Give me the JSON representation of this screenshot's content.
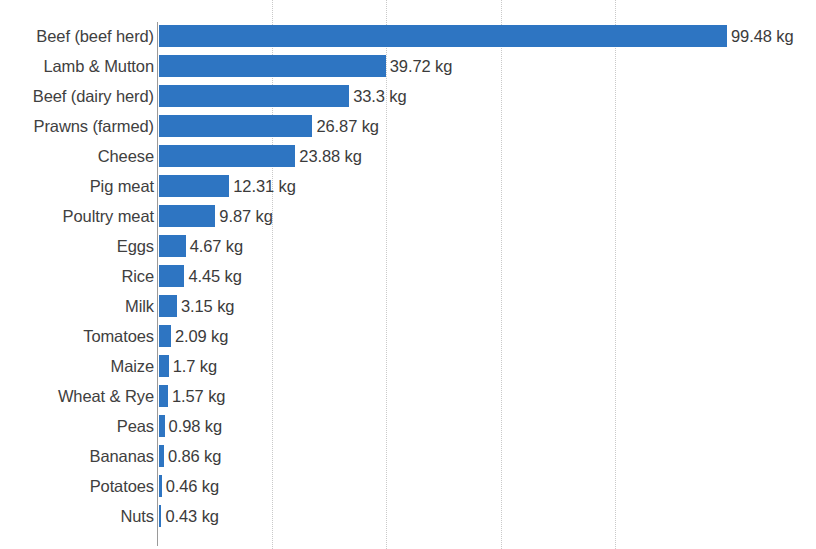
{
  "chart_data": {
    "type": "bar",
    "orientation": "horizontal",
    "title": "",
    "subtitle": "",
    "xlabel": "",
    "ylabel": "",
    "unit": "kg",
    "xlim": [
      0,
      107
    ],
    "gridlines": [
      20,
      40,
      60,
      80
    ],
    "grid": true,
    "legend": false,
    "bar_color": "#2e75c2",
    "label_color": "#404040",
    "value_color": "#3b3b3b",
    "gridline_color": "#c9c9c9",
    "axis_color": "#9a9a9a",
    "categories": [
      "Beef (beef herd)",
      "Lamb & Mutton",
      "Beef (dairy herd)",
      "Prawns (farmed)",
      "Cheese",
      "Pig meat",
      "Poultry meat",
      "Eggs",
      "Rice",
      "Milk",
      "Tomatoes",
      "Maize",
      "Wheat & Rye",
      "Peas",
      "Bananas",
      "Potatoes",
      "Nuts"
    ],
    "values": [
      99.48,
      39.72,
      33.3,
      26.87,
      23.88,
      12.31,
      9.87,
      4.67,
      4.45,
      3.15,
      2.09,
      1.7,
      1.57,
      0.98,
      0.86,
      0.46,
      0.43
    ],
    "value_labels": [
      "99.48 kg",
      "39.72 kg",
      "33.3 kg",
      "26.87 kg",
      "23.88 kg",
      "12.31 kg",
      "9.87 kg",
      "4.67 kg",
      "4.45 kg",
      "3.15 kg",
      "2.09 kg",
      "1.7 kg",
      "1.57 kg",
      "0.98 kg",
      "0.86 kg",
      "0.46 kg",
      "0.43 kg"
    ]
  },
  "layout": {
    "plot_left_px": 158,
    "first_row_top_px": 21,
    "row_pitch_px": 30,
    "px_per_unit": 5.71
  }
}
